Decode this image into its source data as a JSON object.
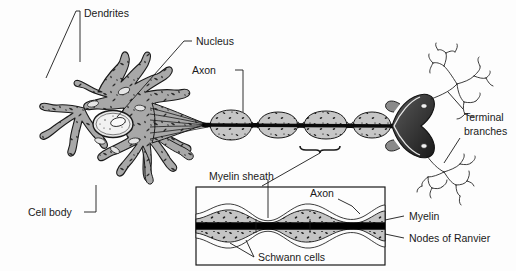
{
  "figure": {
    "background_color": "#fdfdfd",
    "line_color": "#1a1a1a",
    "cytoplasm_fill": "#a8a8a8",
    "myelin_fill": "#c9c9c9",
    "axon_fill": "#111111",
    "nucleus_fill": "#e8e8e8"
  },
  "labels": {
    "dendrites": "Dendrites",
    "nucleus": "Nucleus",
    "axon": "Axon",
    "terminal_branches_line1": "Terminal",
    "terminal_branches_line2": "branches",
    "cell_body": "Cell body",
    "myelin_sheath": "Myelin sheath",
    "inset_axon": "Axon",
    "myelin": "Myelin",
    "nodes_of_ranvier": "Nodes of Ranvier",
    "schwann_cells": "Schwann cells"
  },
  "parts": [
    {
      "id": "dendrites",
      "name": "Dendrites"
    },
    {
      "id": "cell-body",
      "name": "Cell body"
    },
    {
      "id": "nucleus",
      "name": "Nucleus"
    },
    {
      "id": "axon",
      "name": "Axon"
    },
    {
      "id": "myelin-sheath",
      "name": "Myelin sheath"
    },
    {
      "id": "schwann-cells",
      "name": "Schwann cells"
    },
    {
      "id": "nodes-of-ranvier",
      "name": "Nodes of Ranvier"
    },
    {
      "id": "terminal-branches",
      "name": "Terminal branches"
    }
  ]
}
